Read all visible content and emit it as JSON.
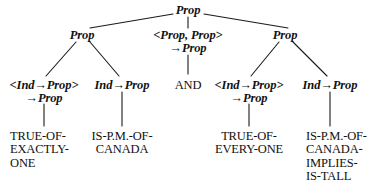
{
  "diagram": {
    "type": "parse-tree",
    "background_color": "#ffffff",
    "text_color": "#111111",
    "edge_color": "#1a1a1a"
  },
  "nodes": {
    "root": {
      "label": "Prop",
      "x": 188,
      "y": 4
    },
    "left_prop": {
      "label": "Prop",
      "x": 82,
      "y": 29
    },
    "mid_type": {
      "line1": "<Prop, Prop>",
      "line2": "→Prop",
      "x": 188,
      "y": 29
    },
    "right_prop": {
      "label": "Prop",
      "x": 285,
      "y": 29
    },
    "type1": {
      "line1": "<Ind→Prop>",
      "line2": "→Prop",
      "x": 44,
      "y": 79
    },
    "type2": {
      "line1": "Ind→Prop",
      "x": 122,
      "y": 79
    },
    "and_const": {
      "line1": "AND",
      "x": 188,
      "y": 79
    },
    "type4": {
      "line1": "<Ind→Prop>",
      "line2": "→Prop",
      "x": 249,
      "y": 79
    },
    "type5": {
      "line1": "Ind→Prop",
      "x": 330,
      "y": 79
    },
    "leaf1": {
      "lines": [
        "TRUE-OF-",
        "EXACTLY-",
        "ONE"
      ],
      "x": 10,
      "y": 130
    },
    "leaf2": {
      "lines": [
        "IS-P.M.-OF-",
        "CANADA"
      ],
      "x": 122,
      "y": 130
    },
    "leaf4": {
      "lines": [
        "TRUE-OF-",
        "EVERY-ONE"
      ],
      "x": 249,
      "y": 130
    },
    "leaf5": {
      "lines": [
        "IS-P.M.-OF-",
        "CANADA-",
        "IMPLIES-",
        "IS-TALL"
      ],
      "x": 306,
      "y": 130
    }
  },
  "edges": [
    {
      "name": "root-to-left-prop",
      "x1": 173,
      "y1": 14,
      "x2": 90,
      "y2": 28
    },
    {
      "name": "root-to-mid-type",
      "x1": 188,
      "y1": 17,
      "x2": 188,
      "y2": 28
    },
    {
      "name": "root-to-right-prop",
      "x1": 204,
      "y1": 14,
      "x2": 288,
      "y2": 28
    },
    {
      "name": "left-prop-to-type1",
      "x1": 76,
      "y1": 42,
      "x2": 46,
      "y2": 76
    },
    {
      "name": "left-prop-to-type2",
      "x1": 90,
      "y1": 42,
      "x2": 119,
      "y2": 76
    },
    {
      "name": "mid-type-to-and",
      "x1": 188,
      "y1": 55,
      "x2": 188,
      "y2": 74
    },
    {
      "name": "right-prop-to-type4",
      "x1": 279,
      "y1": 42,
      "x2": 251,
      "y2": 76
    },
    {
      "name": "right-prop-to-type5",
      "x1": 293,
      "y1": 42,
      "x2": 327,
      "y2": 76
    },
    {
      "name": "type1-to-leaf1",
      "x1": 44,
      "y1": 104,
      "x2": 44,
      "y2": 126
    },
    {
      "name": "type2-to-leaf2",
      "x1": 122,
      "y1": 92,
      "x2": 122,
      "y2": 126
    },
    {
      "name": "type4-to-leaf4",
      "x1": 249,
      "y1": 104,
      "x2": 249,
      "y2": 126
    },
    {
      "name": "type5-to-leaf5",
      "x1": 330,
      "y1": 92,
      "x2": 330,
      "y2": 126
    }
  ]
}
